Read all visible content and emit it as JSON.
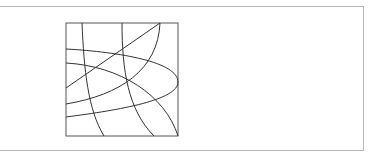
{
  "figure": {
    "stroke_color": "#333333",
    "border_color": "#555555",
    "frame_color": "#b8b8b8",
    "square": {
      "x": 66,
      "y": 23,
      "width": 112,
      "height": 113
    },
    "paths": [
      "M82,23 C84,70 88,110 104,136",
      "M122,23 C122,70 128,110 154,136",
      "M66,88 L160,23",
      "M160,23 C158,70 120,95 66,104",
      "M66,49 C120,52 178,62 178,82 C178,100 120,110 66,117",
      "M66,63 C120,66 165,95 178,136"
    ]
  }
}
